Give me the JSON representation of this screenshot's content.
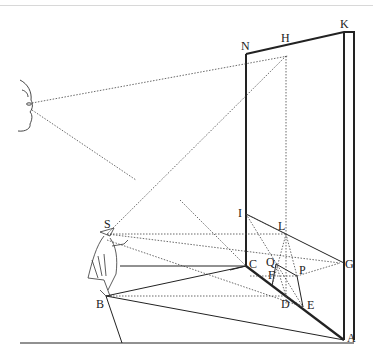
{
  "diagram": {
    "labels": {
      "N": "N",
      "H": "H",
      "K": "K",
      "S": "S",
      "I": "I",
      "L": "L",
      "C": "C",
      "Q": "Q",
      "F": "F",
      "P": "P",
      "G": "G",
      "D": "D",
      "E": "E",
      "B": "B",
      "A": "A"
    },
    "figures": [
      "eye-profile",
      "standing-figure"
    ],
    "colors": {
      "line": "#222222",
      "dotted": "#444444",
      "background": "#ffffff",
      "frame": "#d8d8d8"
    }
  }
}
